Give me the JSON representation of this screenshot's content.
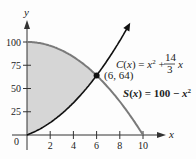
{
  "chart_data": {
    "type": "line",
    "title": "",
    "xlabel": "x",
    "ylabel": "y",
    "xlim": [
      0,
      10
    ],
    "ylim": [
      0,
      100
    ],
    "x_ticks": [
      0,
      2,
      4,
      6,
      8,
      10
    ],
    "y_ticks": [
      25,
      50,
      75,
      100
    ],
    "grid": false,
    "series": [
      {
        "name": "C(x) = x^2 + 14/3 x",
        "color": "#111111",
        "x": [
          0,
          1,
          2,
          3,
          4,
          5,
          6,
          7,
          8,
          8.9
        ],
        "values": [
          0,
          5.67,
          13.33,
          23,
          34.67,
          48.33,
          64,
          81.67,
          101.33,
          121.7
        ]
      },
      {
        "name": "S(x) = 100 - x^2",
        "color": "#777777",
        "x": [
          0,
          1,
          2,
          3,
          4,
          5,
          6,
          7,
          8,
          9,
          10
        ],
        "values": [
          100,
          99,
          96,
          91,
          84,
          75,
          64,
          51,
          36,
          19,
          0
        ]
      }
    ],
    "shaded_region": {
      "between": [
        "S(x)",
        "C(x)"
      ],
      "x_range": [
        0,
        6
      ],
      "color": "#d9d9d9"
    },
    "annotations": [
      {
        "text": "(6, 64)",
        "x": 6,
        "y": 64
      },
      {
        "text": "C(x) = x^2 + 14/3 x"
      },
      {
        "text": "S(x) = 100 − x^2"
      }
    ]
  },
  "labels": {
    "x_axis": "x",
    "y_axis": "y",
    "origin": "0",
    "xticks": [
      "2",
      "4",
      "6",
      "8",
      "10"
    ],
    "yticks": [
      "25",
      "50",
      "75",
      "100"
    ],
    "point": "(6, 64)",
    "c_name": "C(x) = x",
    "c_rest": " + ",
    "c_num": "14",
    "c_den": "3",
    "c_var": "x",
    "s_name": "S(x) = 100 − x",
    "sup2": "2"
  }
}
